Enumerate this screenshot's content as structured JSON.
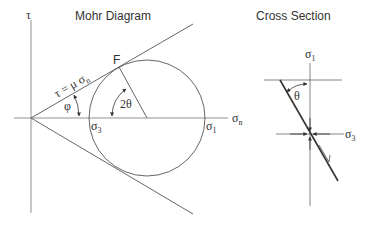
{
  "mohr": {
    "title": "Mohr Diagram",
    "tau_axis_label": "τ",
    "sigma_n_label": "σ",
    "sigma_n_sub": "n",
    "sigma3_label": "σ",
    "sigma3_sub": "3",
    "sigma1_label": "σ",
    "sigma1_sub": "1",
    "failure_point_label": "F",
    "envelope_label": "τ = μ σ",
    "envelope_sub": "n",
    "phi_label": "φ",
    "two_theta_label": "2θ"
  },
  "cross_section": {
    "title": "Cross Section",
    "sigma1_label": "σ",
    "sigma1_sub": "1",
    "sigma3_label": "σ",
    "sigma3_sub": "3",
    "theta_label": "θ"
  },
  "colors": {
    "line": "#555555",
    "text": "#333333",
    "background": "#ffffff"
  }
}
